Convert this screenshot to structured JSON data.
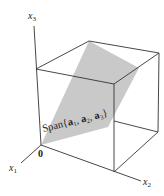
{
  "figure": {
    "type": "3d-unit-cube-with-plane",
    "colors": {
      "plane": "#c9c9c9",
      "edges": "#333333",
      "background": "#ffffff"
    },
    "axes": {
      "x1": {
        "name": "x",
        "sub": "1"
      },
      "x2": {
        "name": "x",
        "sub": "2"
      },
      "x3": {
        "name": "x",
        "sub": "3"
      }
    },
    "origin_label": "0",
    "span_label": {
      "prefix": "Span",
      "open": "{",
      "close": "}",
      "vectors": [
        {
          "name": "a",
          "sub": "1"
        },
        {
          "name": "a",
          "sub": "2"
        },
        {
          "name": "a",
          "sub": "3"
        }
      ],
      "separator": ", "
    }
  }
}
